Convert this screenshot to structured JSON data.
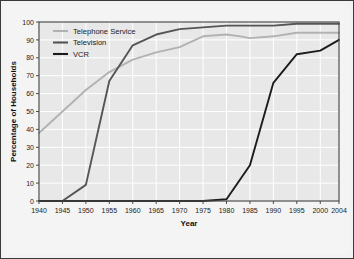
{
  "chart_data": {
    "type": "line",
    "title": "",
    "xlabel": "Year",
    "ylabel": "Percentage of Households",
    "xlim": [
      1940,
      2004
    ],
    "ylim": [
      0,
      100
    ],
    "grid": true,
    "legend_position": "top-left",
    "xticks": [
      1940,
      1945,
      1950,
      1955,
      1960,
      1965,
      1970,
      1975,
      1980,
      1985,
      1990,
      1995,
      2000,
      2004
    ],
    "xtick_labels": [
      "1940",
      "1945",
      "1950",
      "1955",
      "1960",
      "1965",
      "1970",
      "1975",
      "1980",
      "1985",
      "1990",
      "1995",
      "2000",
      "2004"
    ],
    "yticks": [
      0,
      10,
      20,
      30,
      40,
      50,
      60,
      70,
      80,
      90,
      100
    ],
    "ytick_labels": [
      "0",
      "10",
      "20",
      "30",
      "40",
      "50",
      "60",
      "70",
      "80",
      "90",
      "100"
    ],
    "series": [
      {
        "name": "Telephone Service",
        "color": "#b2b2b2",
        "x": [
          1940,
          1945,
          1950,
          1955,
          1960,
          1965,
          1970,
          1975,
          1980,
          1983,
          1985,
          1990,
          1995,
          2000,
          2004
        ],
        "values": [
          38,
          50,
          62,
          72,
          79,
          83,
          86,
          92,
          93,
          92,
          91,
          92,
          94,
          94,
          94
        ]
      },
      {
        "name": "Television",
        "color": "#555555",
        "x": [
          1940,
          1945,
          1950,
          1955,
          1960,
          1965,
          1970,
          1975,
          1980,
          1985,
          1990,
          1995,
          2000,
          2004
        ],
        "values": [
          0,
          0,
          9,
          67,
          87,
          93,
          96,
          97,
          98,
          98,
          98,
          99,
          99,
          99
        ]
      },
      {
        "name": "VCR",
        "color": "#1c1c1c",
        "x": [
          1940,
          1975,
          1980,
          1985,
          1990,
          1995,
          2000,
          2004
        ],
        "values": [
          0,
          0,
          1,
          20,
          66,
          82,
          84,
          90
        ]
      }
    ]
  },
  "legend": {
    "items": [
      {
        "label": "Telephone Service",
        "color": "#b2b2b2"
      },
      {
        "label": "Television",
        "color": "#555555"
      },
      {
        "label": "VCR",
        "color": "#1c1c1c"
      }
    ]
  },
  "axes": {
    "x_title": "Year",
    "y_title": "Percentage of Households"
  },
  "style": {
    "plot_background": "#e8e8e8",
    "grid_color": "#ffffff",
    "frame_color": "#4a4a4a",
    "page_background": "#f4f4f4",
    "border_color": "#3a3a3a"
  }
}
